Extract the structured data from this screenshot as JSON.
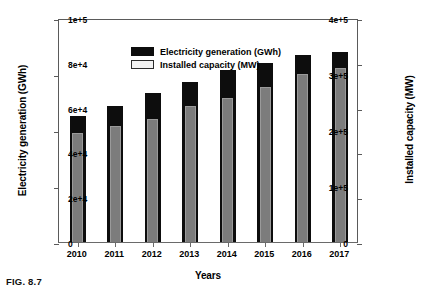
{
  "caption": "FIG. 8.7",
  "chart_data": {
    "type": "bar",
    "title": "",
    "xlabel": "Years",
    "ylabel": "Electricity generation (GWh)",
    "y2label": "Installed capacity (MW)",
    "categories": [
      "2010",
      "2011",
      "2012",
      "2013",
      "2014",
      "2015",
      "2016",
      "2017"
    ],
    "series": [
      {
        "name": "Electricity generation (GWh)",
        "axis": "left",
        "color": "#0d0d0d",
        "values": [
          225000,
          242000,
          266000,
          285000,
          308000,
          320000,
          334000,
          340000
        ]
      },
      {
        "name": "Installed capacity (MW)",
        "axis": "right",
        "color": "#7c7c7c",
        "values": [
          48500,
          52000,
          55000,
          60500,
          64500,
          69000,
          75000,
          77500
        ]
      }
    ],
    "ylim": [
      0,
      400000
    ],
    "y2lim": [
      0,
      100000
    ],
    "yticks": [
      {
        "value": 0,
        "label": "0"
      },
      {
        "value": 100000,
        "label": "1e+5"
      },
      {
        "value": 200000,
        "label": "2e+5"
      },
      {
        "value": 300000,
        "label": "3e+5"
      },
      {
        "value": 400000,
        "label": "4e+5"
      }
    ],
    "y2ticks": [
      {
        "value": 0,
        "label": "0"
      },
      {
        "value": 20000,
        "label": "2e+4"
      },
      {
        "value": 40000,
        "label": "4e+4"
      },
      {
        "value": 60000,
        "label": "6e+4"
      },
      {
        "value": 80000,
        "label": "8e+4"
      },
      {
        "value": 100000,
        "label": "1e+5"
      }
    ],
    "grid": false,
    "legend_position": "top-left",
    "legend": [
      {
        "label": "Electricity generation (GWh)",
        "swatch": "black"
      },
      {
        "label": "Installed capacity (MW)",
        "swatch": "gray"
      }
    ]
  }
}
